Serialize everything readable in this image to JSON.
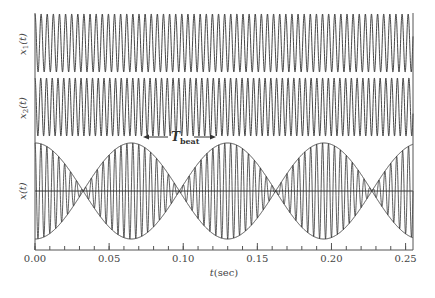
{
  "chart_data": {
    "type": "line",
    "title": "",
    "xlabel": "t(sec)",
    "xlim": [
      0,
      0.255
    ],
    "xticks": [
      0.0,
      0.05,
      0.1,
      0.15,
      0.2,
      0.25
    ],
    "xtick_labels": [
      "0.00",
      "0.05",
      "0.10",
      "0.15",
      "0.20",
      "0.25"
    ],
    "minor_tick_step": 0.01,
    "series": [
      {
        "name": "x1(t)",
        "ylabel": "x₁(t)",
        "function": "cos(2*pi*f1*t)",
        "f1_hz": 242.3,
        "amplitude": 1
      },
      {
        "name": "x2(t)",
        "ylabel": "x₂(t)",
        "function": "cos(2*pi*f2*t)",
        "f2_hz": 257.7,
        "amplitude": 1
      },
      {
        "name": "x(t)",
        "ylabel": "x(t)",
        "function": "x1(t)+x2(t)",
        "amplitude": 2,
        "envelope": "2|cos(pi*(f2-f1)*t)|"
      }
    ],
    "annotations": [
      {
        "text": "T_beat",
        "main": "T",
        "sub": "beat",
        "arrow": "double-headed",
        "x_range": [
          0.072,
          0.117
        ]
      }
    ],
    "beat_period_sec": 0.065,
    "envelope_nulls_sec": [
      0.0325,
      0.0975,
      0.1625,
      0.2275
    ],
    "envelope_peaks_sec": [
      0.0,
      0.065,
      0.13,
      0.195
    ],
    "grid": false,
    "legend": "none"
  },
  "labels": {
    "x1": "x",
    "x1_sub": "1",
    "x2": "x",
    "x2_sub": "2",
    "x": "x(t)",
    "t_arg": "(t)",
    "xlabel_t": "t",
    "xlabel_unit": "(sec)",
    "tbeat_main": "T",
    "tbeat_sub": "beat"
  }
}
